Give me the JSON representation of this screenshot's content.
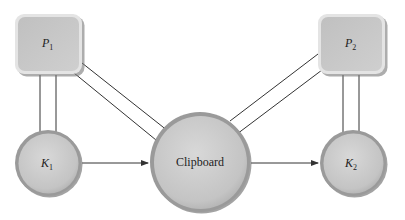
{
  "diagram": {
    "nodes": [
      {
        "id": "P1",
        "shape": "rounded-square",
        "label": "P",
        "subscript": "1"
      },
      {
        "id": "P2",
        "shape": "rounded-square",
        "label": "P",
        "subscript": "2"
      },
      {
        "id": "K1",
        "shape": "circle",
        "label": "K",
        "subscript": "1"
      },
      {
        "id": "Clipboard",
        "shape": "circle",
        "label": "Clipboard"
      },
      {
        "id": "K2",
        "shape": "circle",
        "label": "K",
        "subscript": "2"
      }
    ],
    "edges": [
      {
        "from": "P1",
        "to": "K1",
        "type": "double-line"
      },
      {
        "from": "P1",
        "to": "Clipboard",
        "type": "double-line"
      },
      {
        "from": "P2",
        "to": "Clipboard",
        "type": "double-line"
      },
      {
        "from": "P2",
        "to": "K2",
        "type": "double-line"
      },
      {
        "from": "K1",
        "to": "Clipboard",
        "type": "arrow"
      },
      {
        "from": "Clipboard",
        "to": "K2",
        "type": "arrow"
      }
    ],
    "colors": {
      "fill": "#c8c8c8",
      "rim": "#9a9a9a",
      "line": "#333333"
    }
  }
}
